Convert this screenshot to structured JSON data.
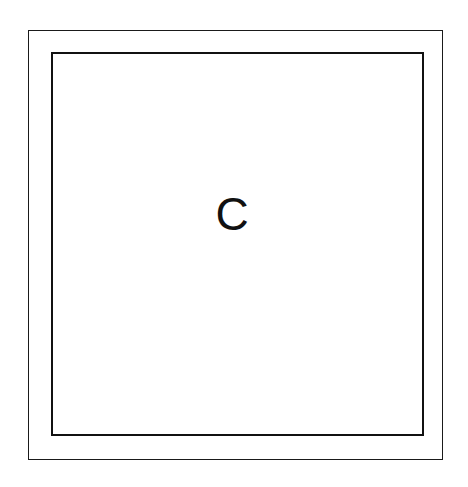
{
  "diagram": {
    "outer_box": {
      "shape": "rectangle",
      "border_color": "#1a1a1a"
    },
    "inner_box": {
      "shape": "rectangle",
      "border_color": "#111111",
      "label": "C"
    }
  }
}
